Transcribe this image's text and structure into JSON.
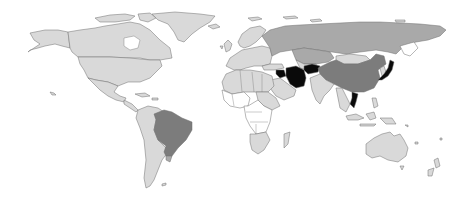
{
  "map": {
    "type": "choropleth-world",
    "title": "",
    "legend": [],
    "palette": {
      "ocean": "#ffffff",
      "no_data": "#ffffff",
      "level_1": "#d9d9d9",
      "level_2": "#a9a9a9",
      "level_3": "#7c7c7c",
      "level_4": "#0a0a0a",
      "border": "#6e6e6e"
    },
    "regions": [
      {
        "name": "Canada",
        "level": "level_1"
      },
      {
        "name": "United States",
        "level": "level_1"
      },
      {
        "name": "Mexico",
        "level": "level_1"
      },
      {
        "name": "Greenland",
        "level": "level_1"
      },
      {
        "name": "Brazil",
        "level": "level_3"
      },
      {
        "name": "South America (other)",
        "level": "level_1"
      },
      {
        "name": "Europe",
        "level": "level_1"
      },
      {
        "name": "Russia",
        "level": "level_2"
      },
      {
        "name": "Kazakhstan / Central Asia",
        "level": "level_2"
      },
      {
        "name": "Mongolia",
        "level": "level_1"
      },
      {
        "name": "China",
        "level": "level_3"
      },
      {
        "name": "Iran",
        "level": "level_4"
      },
      {
        "name": "Afghanistan",
        "level": "level_4"
      },
      {
        "name": "Syria / Iraq",
        "level": "level_4"
      },
      {
        "name": "Japan",
        "level": "level_4"
      },
      {
        "name": "Vietnam",
        "level": "level_4"
      },
      {
        "name": "India",
        "level": "level_1"
      },
      {
        "name": "Middle East (other)",
        "level": "level_1"
      },
      {
        "name": "North Africa",
        "level": "level_1"
      },
      {
        "name": "Sub-Saharan Africa",
        "level": "no_data"
      },
      {
        "name": "South Africa",
        "level": "level_1"
      },
      {
        "name": "Southeast Asia (other)",
        "level": "level_1"
      },
      {
        "name": "Indonesia",
        "level": "level_1"
      },
      {
        "name": "Australia",
        "level": "level_1"
      },
      {
        "name": "New Zealand",
        "level": "level_1"
      }
    ]
  }
}
